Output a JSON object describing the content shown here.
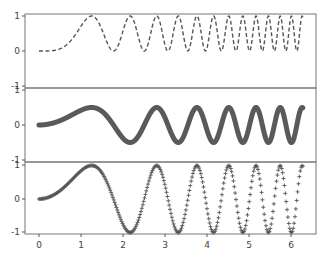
{
  "chart_data": {
    "type": "line",
    "layout": "3 vertically stacked subplots sharing x axis, no vertical spacing",
    "x_range": [
      0,
      6.283
    ],
    "x_ticks": [
      "0",
      "1",
      "2",
      "3",
      "4",
      "5",
      "6"
    ],
    "grid": false,
    "line_color": "#555555",
    "subplots": [
      {
        "name": "top",
        "function": "sin(x^2)^2",
        "style": "dashed line",
        "ylim": [
          -1,
          1
        ],
        "y_ticks": [
          "1",
          "0",
          "-1"
        ],
        "x": [
          0,
          0.5,
          1.0,
          1.25,
          1.5,
          1.77,
          2.17,
          2.5,
          2.8,
          3.07,
          3.32,
          3.54,
          3.76,
          3.96,
          4.15,
          4.34,
          4.52,
          4.69,
          4.85,
          5.01,
          5.17,
          5.32,
          5.47,
          5.61,
          5.75,
          5.89,
          6.02,
          6.15,
          6.28
        ],
        "y": [
          0,
          0.06,
          0.71,
          1.0,
          0.61,
          0.0,
          1.0,
          0.01,
          1.0,
          0.0,
          1.0,
          0.0,
          1.0,
          0.0,
          1.0,
          0.0,
          1.0,
          0.0,
          1.0,
          0.0,
          1.0,
          0.0,
          1.0,
          0.0,
          1.0,
          0.0,
          1.0,
          0.0,
          0.95
        ]
      },
      {
        "name": "middle",
        "function": "0.5*sin(x^2)",
        "style": "thick solid line with dense markers",
        "ylim": [
          -1,
          1
        ],
        "y_ticks": [
          "1",
          "0",
          "-1"
        ],
        "x": [
          0,
          1.25,
          1.77,
          2.17,
          2.8,
          3.32,
          3.76,
          4.15,
          4.52,
          4.85,
          5.17,
          5.47,
          5.75,
          6.02,
          6.28
        ],
        "y": [
          0,
          0.5,
          0,
          -0.5,
          0.5,
          -0.5,
          0.5,
          -0.5,
          0.5,
          -0.5,
          0.5,
          -0.5,
          0.5,
          -0.5,
          0.48
        ]
      },
      {
        "name": "bottom",
        "function": "sin(x^2)",
        "style": "plus markers",
        "ylim": [
          -1,
          1
        ],
        "y_ticks": [
          "1",
          "0",
          "-1"
        ],
        "x": [
          0,
          1.25,
          1.77,
          2.17,
          2.8,
          3.32,
          3.76,
          4.15,
          4.52,
          4.85,
          5.17,
          5.47,
          5.75,
          6.02,
          6.28
        ],
        "y": [
          0,
          1,
          0,
          -1,
          1,
          -1,
          1,
          -1,
          1,
          -1,
          1,
          -1,
          1,
          -1,
          0.98
        ]
      }
    ]
  },
  "axes": {
    "top": {
      "y_ticks": [
        "1",
        "0",
        "-1"
      ]
    },
    "middle": {
      "y_ticks": [
        "1",
        "0",
        "-1"
      ]
    },
    "bottom": {
      "y_ticks": [
        "1",
        "0",
        "-1"
      ]
    },
    "x_ticks": [
      "0",
      "1",
      "2",
      "3",
      "4",
      "5",
      "6"
    ]
  }
}
